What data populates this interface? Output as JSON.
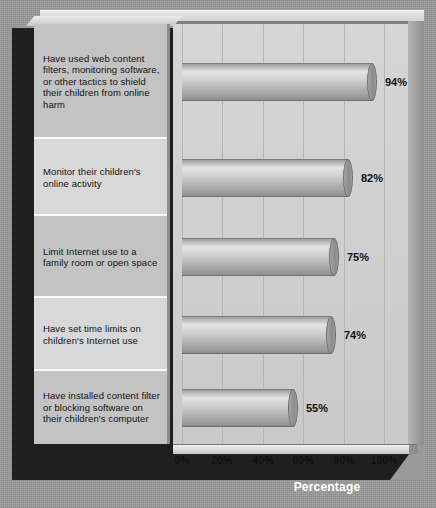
{
  "chart_data": {
    "type": "bar",
    "orientation": "horizontal",
    "title": "",
    "xlabel": "Percentage",
    "ylabel": "",
    "xlim": [
      0,
      110
    ],
    "grid": true,
    "legend": "none",
    "xticks": [
      "0%",
      "20%",
      "40%",
      "60%",
      "80%",
      "100%"
    ],
    "xtick_values": [
      0,
      20,
      40,
      60,
      80,
      100
    ],
    "categories": [
      "Have used web content filters, monitoring software, or other tactics to shield their children from online harm",
      "Monitor their children's online activity",
      "Limit Internet use to a family room or open space",
      "Have set time limits on children's Internet use",
      "Have installed content filter or blocking software on their children's computer"
    ],
    "values": [
      94,
      82,
      75,
      74,
      55
    ],
    "data_labels": [
      "94%",
      "82%",
      "75%",
      "74%",
      "55%"
    ]
  },
  "axis": {
    "title": "Percentage"
  },
  "colors": {
    "background": "#9b9b9b",
    "plot_area": "#d0d0d0",
    "bar_fill": "#c0c0c0",
    "base_dark": "#201f1f",
    "label_panel": "#d3d3d3",
    "text": "#111111",
    "axis_title_text": "#ffffff"
  }
}
